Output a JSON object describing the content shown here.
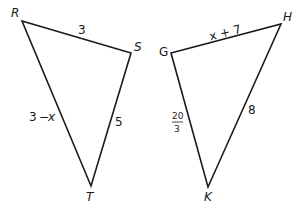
{
  "diagram": {
    "type": "similar-triangles",
    "triangles": [
      {
        "name": "RST",
        "vertices": [
          {
            "label": "R",
            "x": 22,
            "y": 21
          },
          {
            "label": "S",
            "x": 131,
            "y": 53
          },
          {
            "label": "T",
            "x": 91,
            "y": 186
          }
        ],
        "sides": [
          {
            "between": "RS",
            "label": "3"
          },
          {
            "between": "ST",
            "label": "5"
          },
          {
            "between": "RT",
            "label_left": "3",
            "label_op": "−",
            "label_var": "x"
          }
        ]
      },
      {
        "name": "GHK",
        "vertices": [
          {
            "label": "G",
            "x": 171,
            "y": 53
          },
          {
            "label": "H",
            "x": 281,
            "y": 24
          },
          {
            "label": "K",
            "x": 208,
            "y": 187
          }
        ],
        "sides": [
          {
            "between": "GH",
            "label": "x + 7"
          },
          {
            "between": "HK",
            "label": "8"
          },
          {
            "between": "GK",
            "numerator": "20",
            "denominator": "3"
          }
        ]
      }
    ],
    "colors": {
      "stroke": "#1a1a1a",
      "background": "#ffffff"
    }
  }
}
